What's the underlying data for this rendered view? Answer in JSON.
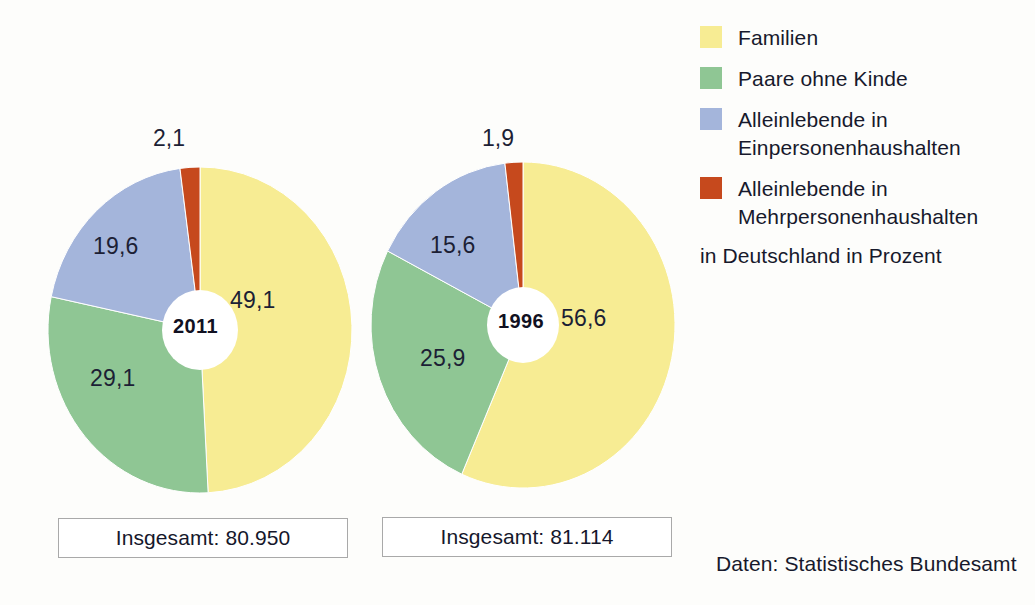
{
  "chart_data": {
    "type": "pie",
    "title": "",
    "subtitle": "",
    "unit_note": "in Deutschland in Prozent",
    "source": "Daten: Statistisches Bundesamt",
    "categories": [
      "Familien",
      "Paare ohne Kinde",
      "Alleinlebende in Einpersonenhaushalten",
      "Alleinlebende in Mehrpersonenhaushalten"
    ],
    "colors": [
      "#F7EC93",
      "#8FC694",
      "#A4B5DB",
      "#C6491D"
    ],
    "legend_position": "right",
    "grid": false,
    "charts": [
      {
        "name": "2011",
        "center_label": "2011",
        "total_label": "Insgesamt: 80.950",
        "total_value": 80950,
        "values": [
          49.1,
          29.1,
          19.6,
          2.1
        ],
        "value_labels": [
          "49,1",
          "29,1",
          "19,6",
          "2,1"
        ]
      },
      {
        "name": "1996",
        "center_label": "1996",
        "total_label": "Insgesamt: 81.114",
        "total_value": 81114,
        "values": [
          56.6,
          25.9,
          15.6,
          1.9
        ],
        "value_labels": [
          "56,6",
          "25,9",
          "15,6",
          "1,9"
        ]
      }
    ]
  },
  "legend": {
    "items": [
      {
        "label": "Familien",
        "line1": "Familien",
        "line2": "",
        "color": "#F7EC93"
      },
      {
        "label": "Paare ohne Kinde",
        "line1": "Paare ohne Kinde",
        "line2": "",
        "color": "#8FC694"
      },
      {
        "label": "Alleinlebende in Einpersonenhaushalten",
        "line1": "Alleinlebende in",
        "line2": "Einpersonenhaushalten",
        "color": "#A4B5DB"
      },
      {
        "label": "Alleinlebende in Mehrpersonenhaushalten",
        "line1": "Alleinlebende in",
        "line2": "Mehrpersonenhaushalten",
        "color": "#C6491D"
      }
    ],
    "unit_note": "in Deutschland in Prozent"
  },
  "pies": {
    "p2011": {
      "center_label": "2011",
      "total_label": "Insgesamt: 80.950",
      "label_yellow": "49,1",
      "label_green": "29,1",
      "label_blue": "19,6",
      "label_orange": "2,1"
    },
    "p1996": {
      "center_label": "1996",
      "total_label": "Insgesamt: 81.114",
      "label_yellow": "56,6",
      "label_green": "25,9",
      "label_blue": "15,6",
      "label_orange": "1,9"
    }
  },
  "source_note": "Daten: Statistisches Bundesamt"
}
